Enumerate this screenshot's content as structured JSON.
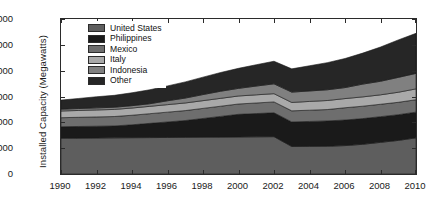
{
  "chart_data": {
    "type": "area",
    "title": "",
    "xlabel": "",
    "ylabel": "Installed Capacity (Megawatts)",
    "xlim": [
      1990,
      2010
    ],
    "ylim": [
      0,
      12000
    ],
    "grid": false,
    "stacked": true,
    "legend_position": "top-left-inside",
    "xticks": [
      "1990",
      "1992",
      "1994",
      "1996",
      "1998",
      "2000",
      "2002",
      "2004",
      "2006",
      "2008",
      "2010"
    ],
    "xtick_values": [
      1990,
      1992,
      1994,
      1996,
      1998,
      2000,
      2002,
      2004,
      2006,
      2008,
      2010
    ],
    "yticks": [
      "0",
      "2,000",
      "4,000",
      "6,000",
      "8,000",
      "10,000",
      "12,000"
    ],
    "ytick_values": [
      0,
      2000,
      4000,
      6000,
      8000,
      10000,
      12000
    ],
    "x": [
      1990,
      1991,
      1992,
      1993,
      1994,
      1995,
      1996,
      1997,
      1998,
      1999,
      2000,
      2001,
      2002,
      2003,
      2004,
      2005,
      2006,
      2007,
      2008,
      2009,
      2010
    ],
    "series": [
      {
        "name": "United States",
        "color": "#5e5e5e",
        "values": [
          2770,
          2780,
          2790,
          2800,
          2810,
          2820,
          2830,
          2840,
          2850,
          2860,
          2870,
          2880,
          2890,
          2130,
          2140,
          2150,
          2200,
          2300,
          2450,
          2600,
          2800
        ]
      },
      {
        "name": "Philippines",
        "color": "#1a1a1a",
        "values": [
          890,
          900,
          910,
          920,
          1000,
          1100,
          1200,
          1300,
          1450,
          1600,
          1750,
          1800,
          1850,
          1900,
          1930,
          1960,
          1980,
          1990,
          1990,
          1990,
          1990
        ]
      },
      {
        "name": "Mexico",
        "color": "#6e6e6e",
        "values": [
          700,
          710,
          720,
          730,
          740,
          750,
          760,
          770,
          780,
          790,
          800,
          820,
          840,
          860,
          870,
          880,
          950,
          960,
          960,
          960,
          960
        ]
      },
      {
        "name": "Italy",
        "color": "#a9a9a9",
        "values": [
          520,
          530,
          540,
          550,
          560,
          570,
          580,
          590,
          600,
          610,
          620,
          630,
          640,
          650,
          680,
          700,
          710,
          720,
          730,
          780,
          840
        ]
      },
      {
        "name": "Indonesia",
        "color": "#808080",
        "values": [
          140,
          150,
          160,
          170,
          180,
          200,
          300,
          380,
          470,
          550,
          590,
          680,
          760,
          800,
          810,
          830,
          850,
          990,
          1050,
          1150,
          1200
        ]
      },
      {
        "name": "Other",
        "color": "#262626",
        "values": [
          700,
          780,
          860,
          920,
          1000,
          1080,
          1150,
          1250,
          1350,
          1450,
          1550,
          1650,
          1750,
          1800,
          1950,
          2100,
          2250,
          2400,
          2650,
          2900,
          3100
        ]
      }
    ]
  },
  "axes": {
    "y_title": "Installed Capacity (Megawatts)"
  }
}
